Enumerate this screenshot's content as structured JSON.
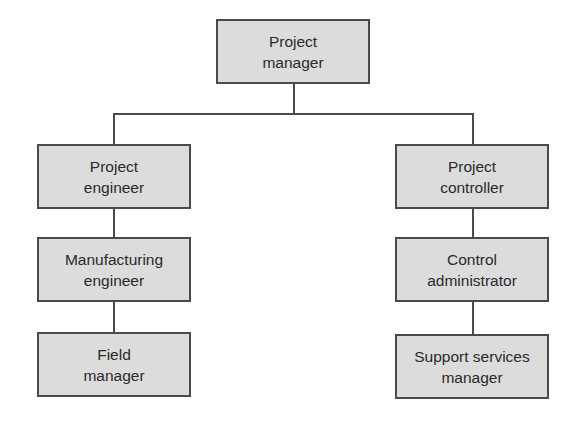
{
  "diagram": {
    "type": "org-chart",
    "root": {
      "label": "Project\nmanager"
    },
    "left_branch": [
      {
        "label": "Project\nengineer"
      },
      {
        "label": "Manufacturing\nengineer"
      },
      {
        "label": "Field\nmanager"
      }
    ],
    "right_branch": [
      {
        "label": "Project\ncontroller"
      },
      {
        "label": "Control\nadministrator"
      },
      {
        "label": "Support services\nmanager"
      }
    ],
    "colors": {
      "box_fill": "#dcdcdc",
      "border": "#4a4a4a",
      "text": "#2a2a2a"
    }
  }
}
